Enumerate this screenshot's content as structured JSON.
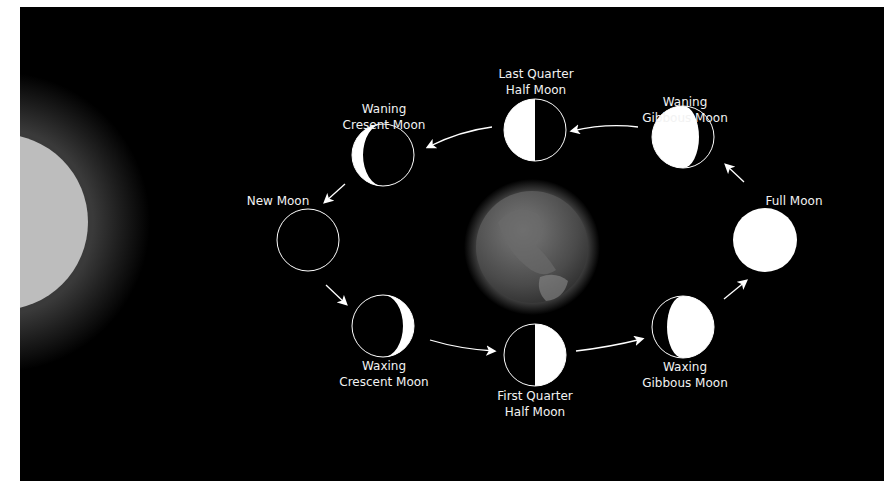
{
  "diagram": {
    "colors": {
      "background": "#000000",
      "frame": "#ffffff",
      "moon_lit": "#ffffff",
      "sun": "#bdbdbd",
      "earth": "#5a5a5a",
      "label": "#f2f2f2"
    },
    "sun": {
      "label": "Sun"
    },
    "earth": {
      "label": "Earth"
    },
    "phases": [
      {
        "id": "new",
        "line1": "New Moon",
        "line2": ""
      },
      {
        "id": "waxing-crescent",
        "line1": "Waxing",
        "line2": "Crescent Moon"
      },
      {
        "id": "first-quarter",
        "line1": "First Quarter",
        "line2": "Half Moon"
      },
      {
        "id": "waxing-gibbous",
        "line1": "Waxing",
        "line2": "Gibbous Moon"
      },
      {
        "id": "full",
        "line1": "Full Moon",
        "line2": ""
      },
      {
        "id": "waning-gibbous",
        "line1": "Waning",
        "line2": "Gibbous Moon"
      },
      {
        "id": "last-quarter",
        "line1": "Last Quarter",
        "line2": "Half Moon"
      },
      {
        "id": "waning-crescent",
        "line1": "Waning",
        "line2": "Cresent Moon"
      }
    ]
  }
}
